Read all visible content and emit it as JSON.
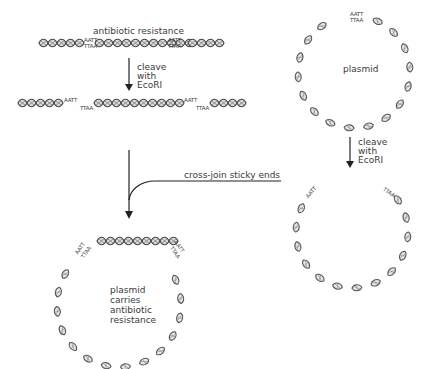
{
  "diagram": {
    "insert_dna": {
      "label": "antibiotic resistance",
      "sticky_top": "AATT",
      "sticky_bottom": "TTAA"
    },
    "step_cleave_left": {
      "line1": "cleave",
      "line2": "with",
      "line3": "EcoRI"
    },
    "fragments": {
      "left_end": "AATT",
      "middle_start": "TTAA",
      "middle_end": "AATT",
      "right_start": "TTAA"
    },
    "plasmid": {
      "label": "plasmid",
      "sticky_top": "AATT",
      "sticky_bottom": "TTAA"
    },
    "step_cleave_right": {
      "line1": "cleave",
      "line2": "with",
      "line3": "EcoRI"
    },
    "opened_plasmid": {
      "left_end": "AATT",
      "right_end": "TTAA"
    },
    "join_step": {
      "label": "cross-join sticky ends"
    },
    "result": {
      "line1": "plasmid",
      "line2": "carries",
      "line3": "antibiotic",
      "line4": "resistance",
      "left_top": "AATT",
      "left_bottom": "TTAA",
      "right_top": "AATT",
      "right_bottom": "TTAA"
    },
    "colors": {
      "helix_stroke": "#555555",
      "helix_fill": "#cfcfcf",
      "insert_fill": "#9a9a9a",
      "arrow": "#222222",
      "text": "#3a3a3a"
    }
  }
}
